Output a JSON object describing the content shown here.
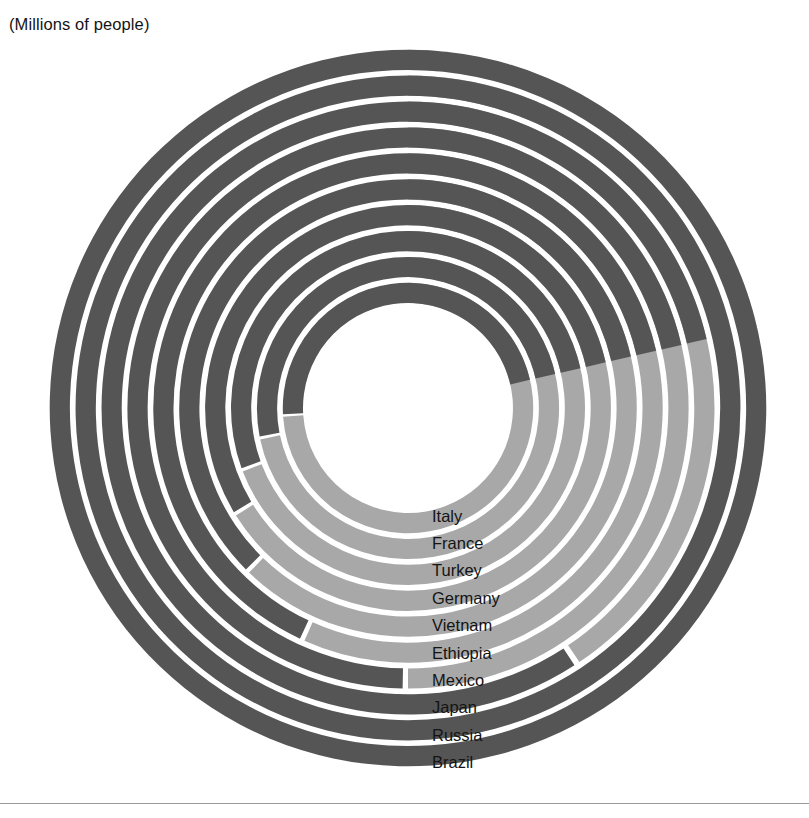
{
  "axis_title": "(Millions of people)",
  "colors": {
    "light": "#a8a8a8",
    "dark": "#555555",
    "background": "#ffffff",
    "gap": "#ffffff",
    "text": "#141414",
    "rule": "#9a9a9a"
  },
  "geometry": {
    "center_x": 408,
    "center_y": 408,
    "inner_radius": 105,
    "band_pitch": 25.9,
    "band_thickness": 20.2,
    "start_angle_deg": 0,
    "end_angle_deg": 90
  },
  "legend": {
    "items": [
      {
        "label": "Italy",
        "swatch": "dark"
      },
      {
        "label": "France",
        "swatch": "dark"
      },
      {
        "label": "Turkey",
        "swatch": "dark"
      },
      {
        "label": "Germany",
        "swatch": "dark"
      },
      {
        "label": "Vietnam",
        "swatch": "dark"
      },
      {
        "label": "Ethiopia",
        "swatch": "dark"
      },
      {
        "label": "Mexico",
        "swatch": "dark"
      },
      {
        "label": "Japan",
        "swatch": "dark"
      },
      {
        "label": "Russia",
        "swatch": "dark"
      },
      {
        "label": "Brazil",
        "swatch": "dark"
      }
    ]
  },
  "chart_data": {
    "type": "radial_bar",
    "title": "(Millions of people)",
    "unit": "Millions of people",
    "xlabel": "",
    "ylabel": "",
    "grid": false,
    "legend_position": "inside-right",
    "rings_outer_to_inner": [
      {
        "name": "Brazil",
        "ring_index": 10,
        "sweep_deg": 437,
        "light_deg": 5,
        "dark_deg": 432,
        "value": 214
      },
      {
        "name": "Russia",
        "ring_index": 9,
        "sweep_deg": 437,
        "light_deg": 23,
        "dark_deg": 414,
        "value": 146
      },
      {
        "name": "Japan",
        "ring_index": 8,
        "sweep_deg": 437,
        "light_deg": 146,
        "dark_deg": 291,
        "value": 126
      },
      {
        "name": "Mexico",
        "ring_index": 7,
        "sweep_deg": 437,
        "light_deg": 180,
        "dark_deg": 257,
        "value": 126
      },
      {
        "name": "Ethiopia",
        "ring_index": 6,
        "sweep_deg": 437,
        "light_deg": 204,
        "dark_deg": 233,
        "value": 118
      },
      {
        "name": "Vietnam",
        "ring_index": 5,
        "sweep_deg": 437,
        "light_deg": 224,
        "dark_deg": 213,
        "value": 98
      },
      {
        "name": "Germany",
        "ring_index": 4,
        "sweep_deg": 437,
        "light_deg": 238,
        "dark_deg": 199,
        "value": 83
      },
      {
        "name": "Turkey",
        "ring_index": 3,
        "sweep_deg": 437,
        "light_deg": 249,
        "dark_deg": 188,
        "value": 85
      },
      {
        "name": "France",
        "ring_index": 2,
        "sweep_deg": 437,
        "light_deg": 258,
        "dark_deg": 179,
        "value": 68
      },
      {
        "name": "Italy",
        "ring_index": 1,
        "sweep_deg": 437,
        "light_deg": 266,
        "dark_deg": 171,
        "value": 59
      }
    ],
    "categories": [
      "Italy",
      "France",
      "Turkey",
      "Germany",
      "Vietnam",
      "Ethiopia",
      "Mexico",
      "Japan",
      "Russia",
      "Brazil"
    ],
    "values": [
      59,
      68,
      85,
      83,
      98,
      118,
      126,
      126,
      146,
      214
    ]
  }
}
